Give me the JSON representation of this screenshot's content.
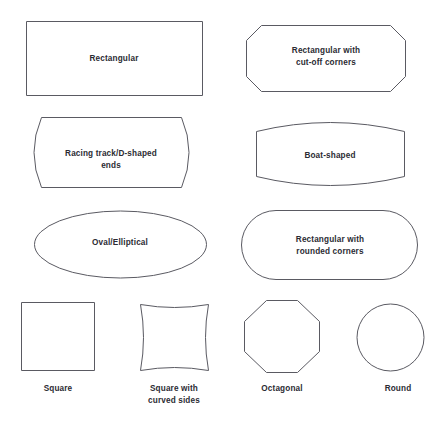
{
  "page": {
    "background_color": "#ffffff",
    "stroke_color": "#5a5a62",
    "text_color": "#2b2b33"
  },
  "shapes": [
    {
      "id": "rectangular",
      "name": "rectangular-shape",
      "label_lines": [
        "Rectangular"
      ],
      "label_position": "inside",
      "geometry": {
        "type": "rect",
        "x": 26,
        "y": 21,
        "width": 176,
        "height": 74
      }
    },
    {
      "id": "rectangular-cut-off-corners",
      "name": "rectangular-cut-off-corners-shape",
      "label_lines": [
        "Rectangular with",
        "cut-off corners"
      ],
      "label_position": "inside",
      "geometry": {
        "type": "chamfered-rect",
        "x": 246,
        "y": 25,
        "width": 160,
        "height": 66,
        "chamfer": 15
      }
    },
    {
      "id": "racing-track-d-shaped-ends",
      "name": "racing-track-d-shaped-ends-shape",
      "label_lines": [
        "Racing track/D-shaped",
        "ends"
      ],
      "label_position": "inside",
      "geometry": {
        "type": "convex-sides",
        "x": 27,
        "y": 117,
        "width": 168,
        "height": 71,
        "bulge": 14
      }
    },
    {
      "id": "boat-shaped",
      "name": "boat-shaped-shape",
      "label_lines": [
        "Boat-shaped"
      ],
      "label_position": "inside",
      "geometry": {
        "type": "convex-top-bottom",
        "x": 256,
        "y": 121,
        "width": 148,
        "height": 66,
        "bulge": 10
      }
    },
    {
      "id": "oval-elliptical",
      "name": "oval-elliptical-shape",
      "label_lines": [
        "Oval/Elliptical"
      ],
      "label_position": "inside",
      "geometry": {
        "type": "ellipse",
        "cx": 120.5,
        "cy": 244.5,
        "rx": 86.5,
        "ry": 33.5
      }
    },
    {
      "id": "rectangular-rounded-corners",
      "name": "rectangular-rounded-corners-shape",
      "label_lines": [
        "Rectangular with",
        "rounded corners"
      ],
      "label_position": "inside",
      "geometry": {
        "type": "stadium",
        "x": 241,
        "y": 210,
        "width": 177,
        "height": 70,
        "radius": 35
      }
    },
    {
      "id": "square",
      "name": "square-shape",
      "label_lines": [
        "Square"
      ],
      "label_position": "below",
      "geometry": {
        "type": "rect",
        "x": 21,
        "y": 302,
        "width": 73,
        "height": 68
      }
    },
    {
      "id": "square-curved-sides",
      "name": "square-with-curved-sides-shape",
      "label_lines": [
        "Square with",
        "curved sides"
      ],
      "label_position": "below",
      "geometry": {
        "type": "concave-square",
        "x": 140,
        "y": 304,
        "width": 68,
        "height": 66,
        "curve": 5
      }
    },
    {
      "id": "octagonal",
      "name": "octagonal-shape",
      "label_lines": [
        "Octagonal"
      ],
      "label_position": "below",
      "geometry": {
        "type": "octagon",
        "x": 244,
        "y": 300,
        "width": 76,
        "height": 72
      }
    },
    {
      "id": "round",
      "name": "round-shape",
      "label_lines": [
        "Round"
      ],
      "label_position": "below",
      "geometry": {
        "type": "circle",
        "cx": 390.5,
        "cy": 337.5,
        "r": 33.5
      }
    }
  ],
  "labels": {
    "rectangular": "Rectangular",
    "rectangular_cut_off_l1": "Rectangular with",
    "rectangular_cut_off_l2": "cut-off corners",
    "racing_track_l1": "Racing track/D-shaped",
    "racing_track_l2": "ends",
    "boat_shaped": "Boat-shaped",
    "oval_elliptical": "Oval/Elliptical",
    "rounded_corners_l1": "Rectangular with",
    "rounded_corners_l2": "rounded corners",
    "square": "Square",
    "square_curved_l1": "Square with",
    "square_curved_l2": "curved sides",
    "octagonal": "Octagonal",
    "round": "Round"
  }
}
